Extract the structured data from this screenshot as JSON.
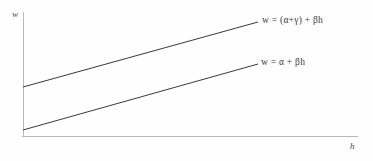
{
  "figure": {
    "background_color": "#fefefe",
    "axis_color": "#b9b9b9",
    "line_color": "#3a3a3a",
    "text_color": "#3d3d3d"
  },
  "axes": {
    "y_label": "w",
    "x_label": "h",
    "y_axis": {
      "x": 23,
      "y_top": 12,
      "y_bottom": 137
    },
    "x_axis": {
      "y": 136,
      "x_left": 22,
      "x_right": 358
    }
  },
  "annotations": {
    "upper_equation": "w = (α+γ) + βh",
    "lower_equation": "w = α + βh"
  },
  "chart_data": {
    "type": "line",
    "title": "",
    "xlabel": "h",
    "ylabel": "w",
    "grid": false,
    "legend_position": "inline-right-end-of-line",
    "axis_arrows": false,
    "xlim": [
      0,
      1
    ],
    "ylim": [
      0,
      1
    ],
    "series": [
      {
        "name": "w = (α+γ) + βh",
        "intercept_label": "(α+γ)",
        "slope_label": "β",
        "x": [
          23,
          258
        ],
        "y": [
          87,
          22
        ],
        "color": "#3a3a3a",
        "width": 1
      },
      {
        "name": "w = α + βh",
        "intercept_label": "α",
        "slope_label": "β",
        "x": [
          23,
          258
        ],
        "y": [
          130,
          64
        ],
        "color": "#3a3a3a",
        "width": 1
      }
    ]
  }
}
